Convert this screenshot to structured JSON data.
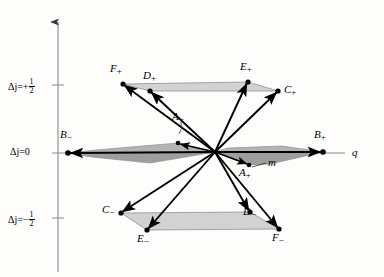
{
  "figure": {
    "background_color": "#fdfdfc",
    "line_color": "#000000",
    "axis_color": "#7a7a7a",
    "shade_fill_light": "#d8d8d8",
    "shade_fill_mid": "#c2c2c2",
    "shade_fill_dark": "#9a9a9a"
  },
  "axes": {
    "vertical": {
      "name": "delta-j-axis",
      "ticks": [
        {
          "label_prefix": "Δj=+",
          "fraction_num": "1",
          "fraction_den": "2",
          "value": "+1/2"
        },
        {
          "label_plain": "Δj=0",
          "value": "0"
        },
        {
          "label_prefix": "Δj=−",
          "fraction_num": "1",
          "fraction_den": "2",
          "value": "-1/2"
        }
      ]
    },
    "horizontal": {
      "name": "q-axis",
      "label": "q"
    }
  },
  "annotations": {
    "m_label": "m"
  },
  "vertices": [
    {
      "id": "F_plus",
      "base": "F",
      "sub": "+",
      "x": 123,
      "y": 84,
      "label_x": 110,
      "label_y": 65
    },
    {
      "id": "D_plus",
      "base": "D",
      "sub": "+",
      "x": 150,
      "y": 91,
      "label_x": 143,
      "label_y": 72
    },
    {
      "id": "E_plus",
      "base": "E",
      "sub": "+",
      "x": 248,
      "y": 82,
      "label_x": 240,
      "label_y": 63
    },
    {
      "id": "C_plus",
      "base": "C",
      "sub": "+",
      "x": 278,
      "y": 91,
      "label_x": 283,
      "label_y": 84
    },
    {
      "id": "B_minus",
      "base": "B",
      "sub": "−",
      "x": 68,
      "y": 153,
      "label_x": 62,
      "label_y": 131
    },
    {
      "id": "B_plus",
      "base": "B",
      "sub": "+",
      "x": 323,
      "y": 152,
      "label_x": 314,
      "label_y": 131
    },
    {
      "id": "A_minus",
      "base": "A",
      "sub": "−",
      "x": 178,
      "y": 143,
      "label_x": 172,
      "label_y": 124
    },
    {
      "id": "A_plus",
      "base": "A",
      "sub": "+",
      "x": 249,
      "y": 165,
      "label_x": 240,
      "label_y": 168
    },
    {
      "id": "C_minus",
      "base": "C",
      "sub": "−",
      "x": 121,
      "y": 213,
      "label_x": 104,
      "label_y": 205
    },
    {
      "id": "E_minus",
      "base": "E",
      "sub": "−",
      "x": 147,
      "y": 230,
      "label_x": 139,
      "label_y": 234
    },
    {
      "id": "D_minus",
      "base": "D",
      "sub": "−",
      "x": 250,
      "y": 212,
      "label_x": 244,
      "label_y": 207
    },
    {
      "id": "F_minus",
      "base": "F",
      "sub": "−",
      "x": 279,
      "y": 229,
      "label_x": 274,
      "label_y": 233
    }
  ],
  "origin": {
    "x": 215,
    "y": 152
  }
}
